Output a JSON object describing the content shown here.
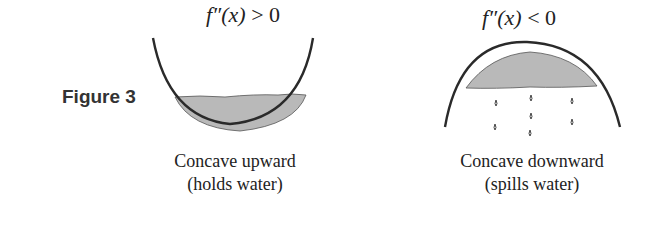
{
  "figure": {
    "label": "Figure 3",
    "panels": [
      {
        "condition_func": "f″(x)",
        "condition_rest": " > 0",
        "caption_line1": "Concave upward",
        "caption_line2": "(holds water)"
      },
      {
        "condition_func": "f″(x)",
        "condition_rest": " < 0",
        "caption_line1": "Concave downward",
        "caption_line2": "(spills water)"
      }
    ],
    "colors": {
      "curve": "#2a2a2a",
      "water": "#b8b8b8"
    }
  }
}
